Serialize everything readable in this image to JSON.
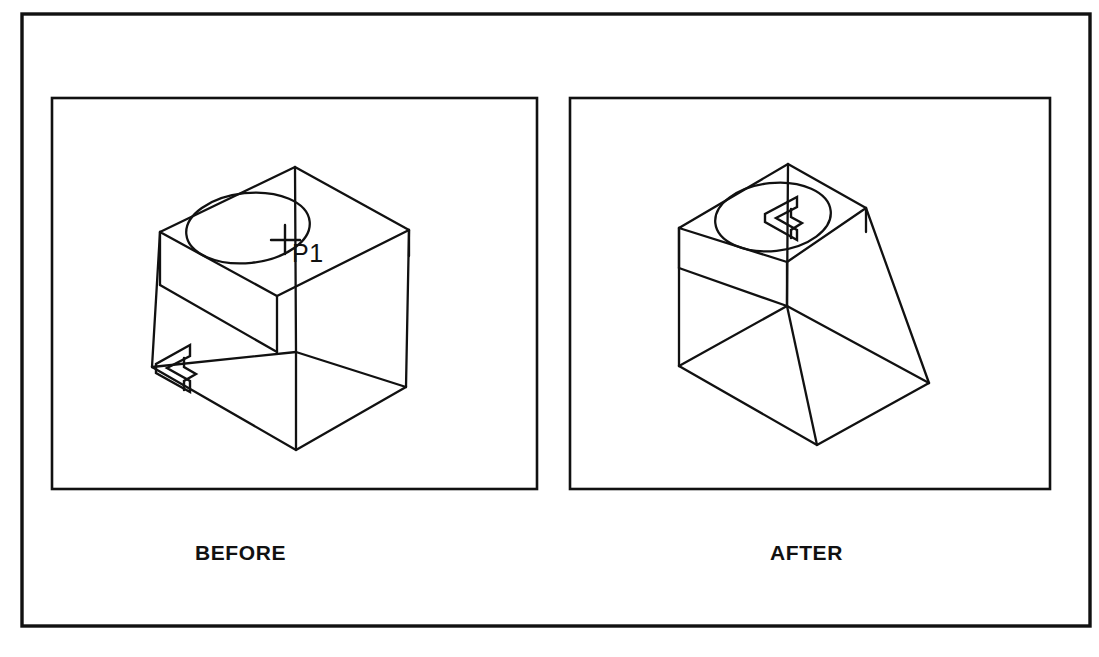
{
  "figure": {
    "line_color": "#111111",
    "background_color": "#ffffff"
  },
  "panels": [
    {
      "id": "before",
      "caption": "BEFORE",
      "marker_position": "base-left-corner",
      "point_label": "P1"
    },
    {
      "id": "after",
      "caption": "AFTER",
      "marker_position": "top-face-circle-center",
      "point_label": ""
    }
  ],
  "labels": {
    "before_caption": "BEFORE",
    "after_caption": "AFTER",
    "point_p1": "P1"
  },
  "geometry": {
    "outer_border": {
      "x": 22,
      "y": 14,
      "width": 1068,
      "height": 612
    },
    "panel_left": {
      "x": 52,
      "y": 98,
      "width": 485,
      "height": 391
    },
    "panel_right": {
      "x": 570,
      "y": 98,
      "width": 480,
      "height": 391
    },
    "caption_left": {
      "x": 235,
      "y": 553
    },
    "caption_right": {
      "x": 800,
      "y": 553
    },
    "solid_left": {
      "top_back": [
        295,
        167
      ],
      "top_left": [
        160,
        232
      ],
      "top_right": [
        409,
        230
      ],
      "top_front": [
        277,
        296
      ],
      "inner_left": [
        160,
        285
      ],
      "inner_front": [
        296,
        352
      ],
      "inner_right": [
        409,
        282
      ],
      "base_left": [
        152,
        367
      ],
      "base_front": [
        296,
        450
      ],
      "base_right": [
        406,
        387
      ],
      "ellipse_cx": 248,
      "ellipse_cy": 228,
      "ellipse_rx": 62,
      "ellipse_ry": 35,
      "crosshair": [
        285,
        240
      ],
      "p1_label": [
        292,
        258
      ],
      "marker_anchor": [
        158,
        368
      ]
    },
    "solid_right": {
      "top_back": [
        788,
        164
      ],
      "top_left": [
        679,
        228
      ],
      "top_right": [
        866,
        208
      ],
      "top_front": [
        787,
        262
      ],
      "inner_left": [
        679,
        268
      ],
      "inner_front": [
        787,
        306
      ],
      "inner_right": [
        866,
        255
      ],
      "base_left": [
        679,
        366
      ],
      "base_front": [
        817,
        445
      ],
      "base_right": [
        929,
        383
      ],
      "ellipse_cx": 773,
      "ellipse_cy": 217,
      "ellipse_rx": 58,
      "ellipse_ry": 34,
      "marker_anchor": [
        789,
        222
      ]
    }
  }
}
